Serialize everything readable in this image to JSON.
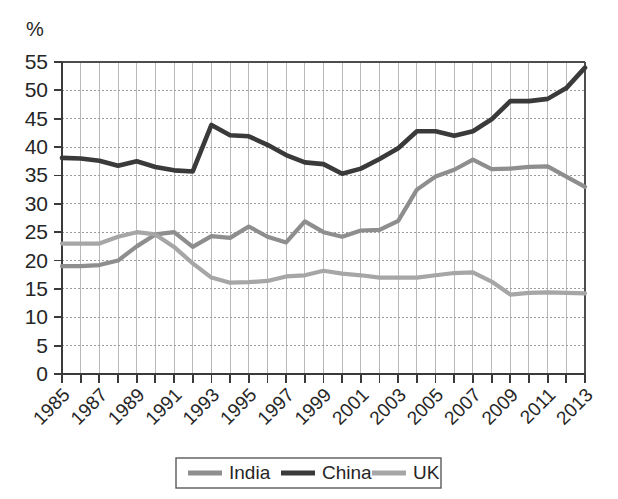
{
  "chart_data": {
    "type": "line",
    "title": "",
    "subtitle": "",
    "xlabel": "",
    "ylabel": "%",
    "y_unit_label": "%",
    "ylim": [
      0,
      55
    ],
    "xlim": [
      1985,
      2013
    ],
    "y_ticks": [
      0,
      5,
      10,
      15,
      20,
      25,
      30,
      35,
      40,
      45,
      50,
      55
    ],
    "y_tick_labels": [
      "0",
      "5",
      "10",
      "15",
      "20",
      "25",
      "30",
      "35",
      "40",
      "45",
      "50",
      "55"
    ],
    "x": [
      1985,
      1986,
      1987,
      1988,
      1989,
      1990,
      1991,
      1992,
      1993,
      1994,
      1995,
      1996,
      1997,
      1998,
      1999,
      2000,
      2001,
      2002,
      2003,
      2004,
      2005,
      2006,
      2007,
      2008,
      2009,
      2010,
      2011,
      2012,
      2013
    ],
    "x_tick_labels": [
      "1985",
      "1987",
      "1989",
      "1991",
      "1993",
      "1995",
      "1997",
      "1999",
      "2001",
      "2003",
      "2005",
      "2007",
      "2009",
      "2011",
      "2013"
    ],
    "x_tick_label_years": [
      1985,
      1987,
      1989,
      1991,
      1993,
      1995,
      1997,
      1999,
      2001,
      2003,
      2005,
      2007,
      2009,
      2011,
      2013
    ],
    "grid": true,
    "legend_position": "bottom",
    "series": [
      {
        "name": "India",
        "color": "#8e8e8e",
        "stroke_width": 4.2,
        "values": [
          19.0,
          19.0,
          19.2,
          20.0,
          22.5,
          24.6,
          25.0,
          22.4,
          24.3,
          24.0,
          26.0,
          24.2,
          23.2,
          26.9,
          25.0,
          24.2,
          25.3,
          25.4,
          27.0,
          32.5,
          34.8,
          36.0,
          37.8,
          36.1,
          36.2,
          36.5,
          36.6,
          34.8,
          33.0
        ]
      },
      {
        "name": "China",
        "color": "#3a3a3a",
        "stroke_width": 4.6,
        "values": [
          38.1,
          38.0,
          37.6,
          36.7,
          37.5,
          36.5,
          35.9,
          35.7,
          43.9,
          42.1,
          41.9,
          40.4,
          38.6,
          37.3,
          37.0,
          35.3,
          36.2,
          37.9,
          39.8,
          42.8,
          42.8,
          42.0,
          42.8,
          44.9,
          48.1,
          48.1,
          48.5,
          50.4,
          54.0
        ]
      },
      {
        "name": "UK",
        "color": "#a6a6a6",
        "stroke_width": 4.2,
        "values": [
          23.0,
          23.0,
          23.0,
          24.2,
          25.0,
          24.6,
          22.4,
          19.5,
          17.0,
          16.1,
          16.2,
          16.4,
          17.2,
          17.4,
          18.2,
          17.7,
          17.4,
          17.0,
          17.0,
          17.0,
          17.4,
          17.8,
          17.9,
          16.3,
          14.0,
          14.3,
          14.4,
          14.3,
          14.2
        ]
      }
    ]
  },
  "legend": {
    "items": [
      {
        "label": "India",
        "color": "#8e8e8e"
      },
      {
        "label": "China",
        "color": "#3a3a3a"
      },
      {
        "label": "UK",
        "color": "#a6a6a6"
      }
    ]
  },
  "axes": {
    "y_unit": "%"
  }
}
